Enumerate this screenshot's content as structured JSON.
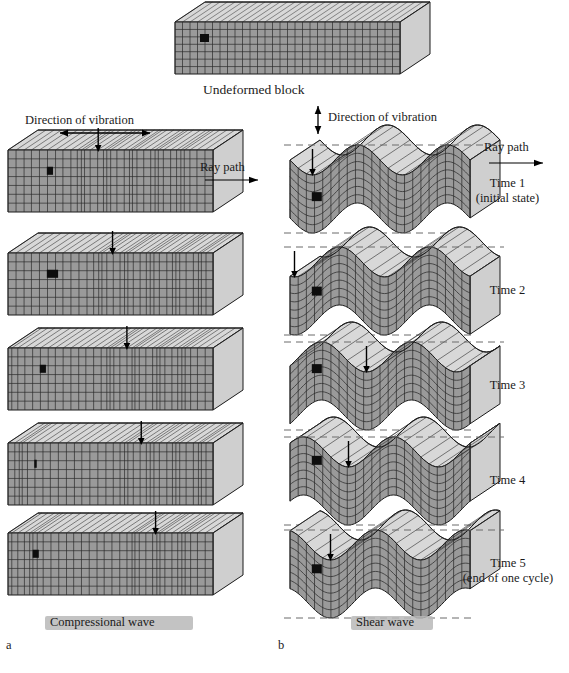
{
  "figure": {
    "title_top": "Undeformed block",
    "panels": [
      {
        "id": "a",
        "letter": "a",
        "caption": "Compressional wave",
        "vibration_label": "Direction of vibration",
        "vibration_axis": "horizontal",
        "ray_path_label": "Ray path"
      },
      {
        "id": "b",
        "letter": "b",
        "caption": "Shear wave",
        "vibration_label": "Direction of vibration",
        "vibration_axis": "vertical",
        "ray_path_label": "Ray path"
      }
    ],
    "time_steps": [
      {
        "label": "Time 1",
        "sub": "(initial state)"
      },
      {
        "label": "Time 2",
        "sub": ""
      },
      {
        "label": "Time 3",
        "sub": ""
      },
      {
        "label": "Time 4",
        "sub": ""
      },
      {
        "label": "Time 5",
        "sub": "(end of one cycle)"
      }
    ],
    "colors": {
      "front_face": "#9a9a9a",
      "top_face": "#d8d8d8",
      "side_face": "#cfcfcf",
      "grid_line": "#2b2b2b",
      "marker": "#0d0d0d",
      "dashed_guide": "#6b6b6b",
      "highlight_bar": "#b9b9b9",
      "outline": "#1a1a1a"
    },
    "icons": {
      "vibration_arrow_h": "double-arrow-horizontal-icon",
      "vibration_arrow_v": "double-arrow-vertical-icon",
      "ray_arrow": "arrow-right-icon",
      "pointer": "arrow-down-icon"
    }
  },
  "chart_data": {
    "type": "diagram",
    "compressional": {
      "description": "Block with rectangular grid; vertical compression bands migrate right with time.",
      "band_centers_fraction": [
        0.3,
        0.44,
        0.58,
        0.72,
        0.86
      ],
      "marker_width_fraction": [
        0.03,
        0.055,
        0.03,
        0.012,
        0.03
      ]
    },
    "shear": {
      "description": "Block sheared into a sinusoid; waveform translates right with time.",
      "wavelength_fraction": 0.5,
      "amplitude_px": 15,
      "phase_deg": [
        0,
        72,
        144,
        216,
        288
      ]
    }
  }
}
